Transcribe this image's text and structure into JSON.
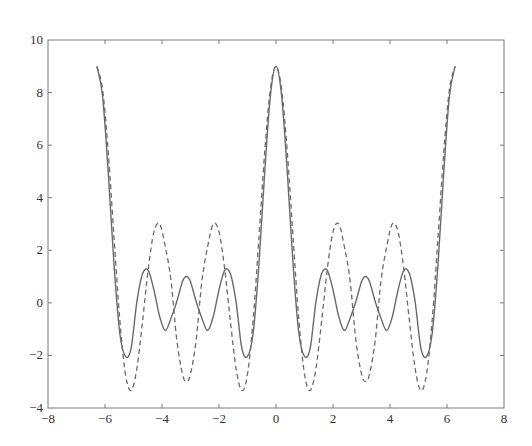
{
  "chart_data": {
    "type": "line",
    "title": "",
    "xlabel": "",
    "ylabel": "",
    "xlim": [
      -8,
      8
    ],
    "ylim": [
      -4,
      10
    ],
    "grid": false,
    "legend": null,
    "x_ticks": [
      -8,
      -6,
      -4,
      -2,
      0,
      2,
      4,
      6,
      8
    ],
    "x_tick_labels": [
      "−8",
      "−6",
      "−4",
      "−2",
      "0",
      "2",
      "4",
      "6",
      "8"
    ],
    "y_ticks": [
      -4,
      -2,
      0,
      2,
      4,
      6,
      8,
      10
    ],
    "y_tick_labels": [
      "−4",
      "−2",
      "0",
      "2",
      "4",
      "6",
      "8",
      "10"
    ],
    "x": [
      -6.2832,
      -6.0832,
      -5.8832,
      -5.6832,
      -5.4832,
      -5.2832,
      -5.0832,
      -4.8832,
      -4.6832,
      -4.4832,
      -4.2832,
      -4.0832,
      -3.8832,
      -3.6832,
      -3.4832,
      -3.2832,
      -3.1416,
      -3.0,
      -2.8,
      -2.6,
      -2.4,
      -2.2,
      -2.0,
      -1.8,
      -1.6,
      -1.4,
      -1.2,
      -1.0,
      -0.8,
      -0.6,
      -0.4,
      -0.2,
      0,
      0.2,
      0.4,
      0.6,
      0.8,
      1.0,
      1.2,
      1.4,
      1.6,
      1.8,
      2.0,
      2.2,
      2.4,
      2.6,
      2.8,
      3.0,
      3.1416,
      3.2832,
      3.4832,
      3.6832,
      3.8832,
      4.0832,
      4.2832,
      4.4832,
      4.6832,
      4.8832,
      5.0832,
      5.2832,
      5.4832,
      5.6832,
      5.8832,
      6.0832,
      6.2832
    ],
    "series": [
      {
        "name": "solid",
        "style": "solid",
        "color": "#6a6a6a",
        "values": [
          9,
          7.846,
          4.902,
          1.446,
          -1.136,
          -2.039,
          -1.719,
          0.026,
          1.107,
          1.238,
          0.49,
          -0.517,
          -1.052,
          -0.584,
          0.04,
          0.806,
          1,
          0.806,
          0.04,
          -0.584,
          -1.052,
          -0.517,
          0.49,
          1.238,
          1.107,
          0.026,
          -1.719,
          -2.039,
          -1.136,
          1.446,
          4.902,
          7.846,
          9,
          7.846,
          4.902,
          1.446,
          -1.136,
          -2.039,
          -1.719,
          0.026,
          1.107,
          1.238,
          0.49,
          -0.517,
          -1.052,
          -0.584,
          0.04,
          0.806,
          1,
          0.806,
          0.04,
          -0.584,
          -1.052,
          -0.517,
          0.49,
          1.238,
          1.107,
          0.026,
          -1.719,
          -2.039,
          -1.136,
          1.446,
          4.902,
          7.846,
          9
        ]
      },
      {
        "name": "dashed",
        "style": "dashed",
        "color": "#6a6a6a",
        "values": [
          9,
          8.104,
          5.685,
          2.467,
          -0.615,
          -2.712,
          -3.338,
          -2.506,
          -0.705,
          1.291,
          2.701,
          3.002,
          2.134,
          0.834,
          -1.399,
          -2.704,
          -3,
          -2.704,
          -1.399,
          0.834,
          2.134,
          3.002,
          2.701,
          1.291,
          -0.705,
          -2.506,
          -3.338,
          -2.712,
          -0.615,
          2.467,
          5.685,
          8.104,
          9,
          8.104,
          5.685,
          2.467,
          -0.615,
          -2.712,
          -3.338,
          -2.506,
          -0.705,
          1.291,
          2.701,
          3.002,
          2.134,
          0.834,
          -1.399,
          -2.704,
          -3,
          -2.704,
          -1.399,
          0.834,
          2.134,
          3.002,
          2.701,
          1.291,
          -0.705,
          -2.506,
          -3.338,
          -2.712,
          -0.615,
          2.467,
          5.685,
          8.104,
          9
        ]
      }
    ]
  }
}
